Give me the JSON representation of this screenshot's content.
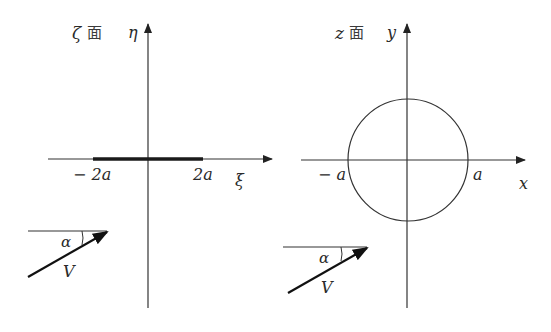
{
  "left_panel": {
    "plane_label": "ζ",
    "plane_suffix": "面",
    "vertical_axis": "η",
    "horizontal_axis": "ξ",
    "segment_left_label": "− 2a",
    "segment_right_label": "2a",
    "angle_label": "α",
    "vector_label": "V"
  },
  "right_panel": {
    "plane_label": "z",
    "plane_suffix": "面",
    "vertical_axis": "y",
    "horizontal_axis": "x",
    "circle_left_label": "− a",
    "circle_right_label": "a",
    "angle_label": "α",
    "vector_label": "V"
  },
  "colors": {
    "line": "#333333",
    "segment": "#1a1a1a"
  }
}
